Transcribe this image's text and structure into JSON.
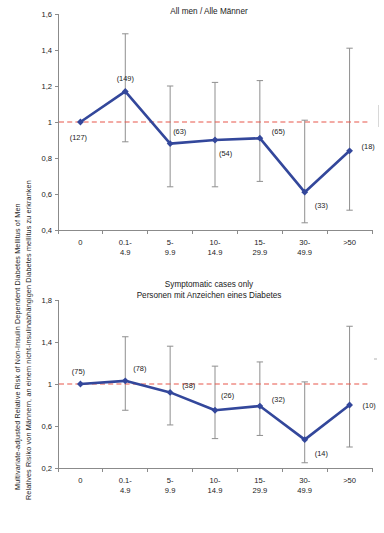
{
  "colors": {
    "series": "#33479b",
    "reference_line": "#e8564a",
    "error_bar": "#8f8f8f",
    "axis": "#8b8b8b",
    "text": "#1a1a1a",
    "background": "#ffffff"
  },
  "ylabel": {
    "english": "Multivariate-adjusted Relative Risk of Non-Insulin Dependent Diabetes Mellitus of Men",
    "german": "Relatives Risiko von Männern, an einem nicht-insulinabhängigen Diabetes mellitus zu erkranken"
  },
  "chart_data": [
    {
      "id": "all-men",
      "type": "line",
      "title": "All men / Alle Männer",
      "title_lines": [
        "All men / Alle Männer"
      ],
      "xlabel": "",
      "ylabel": "Multivariate-adjusted Relative Risk of Non-Insulin Dependent Diabetes Mellitus of Men",
      "categories": [
        "0",
        "0.1-\n4.9",
        "5-\n9.9",
        "10-\n14.9",
        "15-\n29.9",
        "30-\n49.9",
        ">50"
      ],
      "category_lines": [
        [
          "0",
          ""
        ],
        [
          "0.1-",
          "4.9"
        ],
        [
          "5-",
          "9.9"
        ],
        [
          "10-",
          "14.9"
        ],
        [
          "15-",
          "29.9"
        ],
        [
          "30-",
          "49.9"
        ],
        [
          ">50",
          ""
        ]
      ],
      "values": [
        1.0,
        1.17,
        0.88,
        0.9,
        0.91,
        0.61,
        0.84
      ],
      "ci_low": [
        1.0,
        0.89,
        0.64,
        0.64,
        0.67,
        0.44,
        0.51
      ],
      "ci_high": [
        1.0,
        1.49,
        1.2,
        1.22,
        1.23,
        1.01,
        1.41
      ],
      "point_labels": [
        "(127)",
        "(149)",
        "(63)",
        "(54)",
        "(65)",
        "(33)",
        "(18)"
      ],
      "ylim": [
        0.4,
        1.6
      ],
      "yticks": [
        0.4,
        0.6,
        0.8,
        1.0,
        1.2,
        1.4,
        1.6
      ],
      "ytick_labels": [
        "0,4",
        "0,6",
        "0,8",
        "1",
        "1,2",
        "1,4",
        "1,6"
      ],
      "reference_value": 1.0,
      "grid": false,
      "legend": "none"
    },
    {
      "id": "symptomatic-cases",
      "type": "line",
      "title": "Symptomatic cases only / Personen mit Anzeichen eines Diabetes",
      "title_lines": [
        "Symptomatic cases only",
        "Personen mit Anzeichen eines Diabetes"
      ],
      "xlabel": "",
      "ylabel": "Relatives Risiko von Männern, an einem nicht-insulinabhängigen Diabetes mellitus zu erkranken",
      "categories": [
        "0",
        "0.1-\n4.9",
        "5-\n9.9",
        "10-\n14.9",
        "15-\n29.9",
        "30-\n49.9",
        ">50"
      ],
      "category_lines": [
        [
          "0",
          ""
        ],
        [
          "0.1-",
          "4.9"
        ],
        [
          "5-",
          "9.9"
        ],
        [
          "10-",
          "14.9"
        ],
        [
          "15-",
          "29.9"
        ],
        [
          "30-",
          "49.9"
        ],
        [
          ">50",
          ""
        ]
      ],
      "values": [
        1.0,
        1.03,
        0.92,
        0.75,
        0.79,
        0.47,
        0.8
      ],
      "ci_low": [
        1.0,
        0.75,
        0.61,
        0.48,
        0.51,
        0.25,
        0.4
      ],
      "ci_high": [
        1.0,
        1.45,
        1.36,
        1.17,
        1.21,
        1.02,
        1.55
      ],
      "point_labels": [
        "(75)",
        "(78)",
        "(38)",
        "(26)",
        "(32)",
        "(14)",
        "(10)"
      ],
      "ylim": [
        0.2,
        1.8
      ],
      "yticks": [
        0.2,
        0.6,
        1.0,
        1.4,
        1.8
      ],
      "ytick_labels": [
        "0,2",
        "0,6",
        "1",
        "1,4",
        "1,8"
      ],
      "reference_value": 1.0,
      "grid": false,
      "legend": "none"
    }
  ],
  "label_offsets": {
    "all-men": [
      [
        -2,
        18,
        "middle"
      ],
      [
        0,
        -10,
        "middle"
      ],
      [
        3,
        -10,
        "start"
      ],
      [
        4,
        16,
        "start"
      ],
      [
        12,
        -4,
        "start"
      ],
      [
        10,
        16,
        "start"
      ],
      [
        12,
        -2,
        "start"
      ]
    ],
    "symptomatic-cases": [
      [
        -2,
        -10,
        "middle"
      ],
      [
        8,
        -10,
        "start"
      ],
      [
        12,
        -4,
        "start"
      ],
      [
        6,
        -12,
        "start"
      ],
      [
        12,
        -4,
        "start"
      ],
      [
        10,
        16,
        "start"
      ],
      [
        13,
        3,
        "start"
      ]
    ]
  }
}
